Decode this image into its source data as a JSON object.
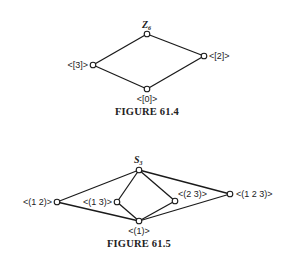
{
  "figures": [
    {
      "caption": "FIGURE 61.4",
      "top_label": "Z",
      "top_subscript": "6",
      "nodes": [
        {
          "id": "Z6",
          "label": "",
          "x": 147,
          "y": 34
        },
        {
          "id": "3",
          "label": "<[3]>",
          "x": 93,
          "y": 65
        },
        {
          "id": "2",
          "label": "<[2]>",
          "x": 204,
          "y": 56
        },
        {
          "id": "0",
          "label": "<[0]>",
          "x": 147,
          "y": 89
        }
      ],
      "edges": [
        [
          "Z6",
          "3"
        ],
        [
          "Z6",
          "2"
        ],
        [
          "3",
          "0"
        ],
        [
          "2",
          "0"
        ]
      ]
    },
    {
      "caption": "FIGURE 61.5",
      "top_label": "S",
      "top_subscript": "3",
      "nodes": [
        {
          "id": "S3",
          "label": "",
          "x": 139,
          "y": 170
        },
        {
          "id": "12",
          "label": "<(1 2)>",
          "x": 57,
          "y": 202
        },
        {
          "id": "13",
          "label": "<(1 3)>",
          "x": 117,
          "y": 202
        },
        {
          "id": "23",
          "label": "<(2 3)>",
          "x": 175,
          "y": 201
        },
        {
          "id": "123",
          "label": "<(1 2 3)>",
          "x": 230,
          "y": 194
        },
        {
          "id": "1",
          "label": "<(1)>",
          "x": 139,
          "y": 221
        }
      ],
      "edges": [
        [
          "S3",
          "12"
        ],
        [
          "S3",
          "13"
        ],
        [
          "S3",
          "23"
        ],
        [
          "S3",
          "123"
        ],
        [
          "12",
          "1"
        ],
        [
          "13",
          "1"
        ],
        [
          "23",
          "1"
        ],
        [
          "123",
          "1"
        ]
      ]
    }
  ]
}
